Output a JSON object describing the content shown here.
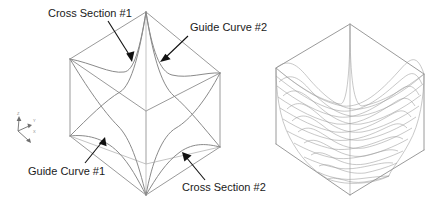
{
  "figure": {
    "width": 434,
    "height": 208,
    "background": "#ffffff",
    "annotations": [
      {
        "id": "cross-section-1",
        "label": "Cross Section #1",
        "text_x": 48,
        "text_y": 16,
        "leader": {
          "x1": 108,
          "y1": 21,
          "x2": 132,
          "y2": 60
        }
      },
      {
        "id": "guide-curve-2",
        "label": "Guide Curve #2",
        "text_x": 190,
        "text_y": 30,
        "leader": {
          "x1": 188,
          "y1": 36,
          "x2": 160,
          "y2": 62
        }
      },
      {
        "id": "guide-curve-1",
        "label": "Guide Curve #1",
        "text_x": 28,
        "text_y": 174,
        "leader": {
          "x1": 85,
          "y1": 163,
          "x2": 104,
          "y2": 138
        }
      },
      {
        "id": "cross-section-2",
        "label": "Cross Section #2",
        "text_x": 182,
        "text_y": 190,
        "leader": {
          "x1": 205,
          "y1": 180,
          "x2": 182,
          "y2": 152
        }
      }
    ],
    "axis_triad": {
      "origin_x": 18,
      "origin_y": 131,
      "axes": [
        {
          "name": "z-axis",
          "label": "Z",
          "tip_x": 19,
          "tip_y": 117,
          "label_x": 17,
          "label_y": 115
        },
        {
          "name": "y-axis",
          "label": "Y",
          "tip_x": 30,
          "tip_y": 125,
          "label_x": 31,
          "label_y": 122
        },
        {
          "name": "x-axis",
          "label": "X",
          "tip_x": 29,
          "tip_y": 142,
          "label_x": 31,
          "label_y": 131
        }
      ]
    },
    "left_figure": {
      "name": "curve-network-wireframe",
      "caption_role": "boundary curve network inside bounding box",
      "box": {
        "top_apex": [
          146,
          12
        ],
        "upper_left": [
          70,
          59
        ],
        "upper_right": [
          220,
          73
        ],
        "center": [
          146,
          111
        ],
        "lower_left": [
          70,
          136
        ],
        "lower_right": [
          220,
          147
        ],
        "bottom_apex": [
          146,
          195
        ]
      },
      "curves": [
        {
          "name": "cross-section-1",
          "role": "cross section"
        },
        {
          "name": "cross-section-2",
          "role": "cross section"
        },
        {
          "name": "guide-curve-1",
          "role": "guide curve"
        },
        {
          "name": "guide-curve-2",
          "role": "guide curve"
        }
      ]
    },
    "right_figure": {
      "name": "lofted-mesh-surface",
      "caption_role": "resulting network surface shown as isoparametric mesh",
      "box": {
        "top_apex": [
          350,
          24
        ],
        "upper_left": [
          276,
          68
        ],
        "upper_right": [
          424,
          74
        ],
        "center": [
          350,
          116
        ],
        "lower_left": [
          276,
          144
        ],
        "lower_right": [
          424,
          150
        ],
        "bottom_apex": [
          350,
          195
        ]
      },
      "mesh": {
        "u_divisions": 10,
        "v_divisions": 10
      }
    },
    "colors": {
      "wire": "#8e8e8e",
      "mesh": "#9a9a9a",
      "leader": "#111111",
      "text": "#1a1a1a",
      "axis": "#6f6f6f"
    }
  }
}
